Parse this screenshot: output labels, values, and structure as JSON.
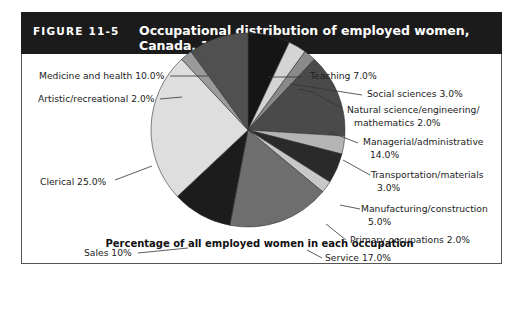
{
  "figure": {
    "number": "FIGURE 11-5",
    "title": "Occupational distribution of employed women, Canada, 1996",
    "caption": "Percentage of all employed women in each occupation"
  },
  "chart_data": {
    "type": "pie",
    "title": "Occupational distribution of employed women, Canada, 1996",
    "subtitle": "Percentage of all employed women in each occupation",
    "unit": "%",
    "categories": [
      "Teaching",
      "Social sciences",
      "Natural science/engineering/mathematics",
      "Managerial/administrative",
      "Transportation/materials",
      "Manufacturing/construction",
      "Primary occupations",
      "Service",
      "Sales",
      "Clerical",
      "Artistic/recreational",
      "Medicine and health"
    ],
    "values": [
      7.0,
      3.0,
      2.0,
      14.0,
      3.0,
      5.0,
      2.0,
      17.0,
      10.0,
      25.0,
      2.0,
      10.0
    ],
    "colors": [
      "#151515",
      "#d4d4d4",
      "#8a8a8a",
      "#4a4a4a",
      "#b4b4b4",
      "#2a2a2a",
      "#c8c8c8",
      "#6e6e6e",
      "#1c1c1c",
      "#dedede",
      "#9a9a9a",
      "#505050"
    ],
    "start_angle_deg": 0,
    "direction": "clockwise"
  },
  "labels": {
    "teaching": "Teaching 7.0%",
    "social": "Social sciences 3.0%",
    "natural1": "Natural science/engineering/",
    "natural2": "mathematics 2.0%",
    "managerial1": "Managerial/administrative",
    "managerial2": "14.0%",
    "transport1": "Transportation/materials",
    "transport2": "3.0%",
    "manufacturing1": "Manufacturing/construction",
    "manufacturing2": "5.0%",
    "primary": "Primary occupations 2.0%",
    "service": "Service 17.0%",
    "sales": "Sales 10%",
    "clerical": "Clerical 25.0%",
    "artistic": "Artistic/recreational 2.0%",
    "medicine": "Medicine and health 10.0%"
  }
}
